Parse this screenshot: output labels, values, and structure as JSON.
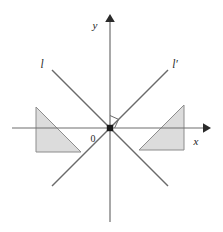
{
  "figure": {
    "type": "geometry-diagram",
    "width": 223,
    "height": 232,
    "background_color": "#ffffff",
    "axes": {
      "x_axis": {
        "label": "x",
        "color": "#6e6e6e",
        "y_position": 128,
        "x_start": 12,
        "x_end": 205,
        "arrow": "right"
      },
      "y_axis": {
        "label": "y",
        "color": "#6e6e6e",
        "x_position": 110,
        "y_start": 222,
        "y_end": 18,
        "arrow": "up"
      },
      "origin": {
        "label": "0",
        "x": 110,
        "y": 128,
        "marker": "filled-square",
        "marker_color": "#1a1a1a"
      }
    },
    "lines": [
      {
        "id": "line-l",
        "label": "l",
        "color": "#6a6a6a",
        "slope": -1,
        "x1": 52,
        "y1": 70,
        "x2": 168,
        "y2": 186
      },
      {
        "id": "line-l-prime",
        "label": "l′",
        "color": "#6a6a6a",
        "slope": 1,
        "x1": 52,
        "y1": 186,
        "x2": 168,
        "y2": 70
      }
    ],
    "right_angle_marker": {
      "name": "right-angle-marker",
      "color": "#6a6a6a",
      "vertex_x": 110,
      "vertex_y": 128,
      "size": 9
    },
    "shapes": [
      {
        "id": "triangle-left",
        "name": "shaded-triangle-left",
        "fill": "#dcdcdc",
        "stroke": "#8c8c8c",
        "points": "36,107 36,152 81,152",
        "quadrant": "second-third"
      },
      {
        "id": "triangle-right",
        "name": "shaded-triangle-right",
        "fill": "#dcdcdc",
        "stroke": "#8c8c8c",
        "points": "139,150 184,105 184,150",
        "quadrant": "first-fourth"
      }
    ],
    "labels": {
      "x_label": "x",
      "y_label": "y",
      "origin_label": "0",
      "line_l_label": "l",
      "line_l_prime_label": "l′"
    }
  }
}
